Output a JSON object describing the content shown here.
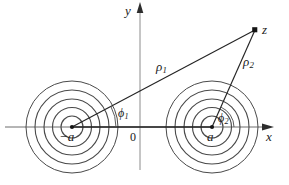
{
  "figure": {
    "background_color": "#ffffff",
    "stroke_color": "#3c3c3c",
    "axis_color": "#555555",
    "circle_color": "#4a4a4a",
    "ray_color": "#2a2a2a",
    "label_color": "#1a1a1a",
    "width": 289,
    "height": 185
  },
  "axes": {
    "x_label": "x",
    "y_label": "y",
    "origin_label": "0",
    "x_axis": {
      "x1": 5,
      "y1": 127,
      "x2": 272,
      "y2": 127
    },
    "y_axis": {
      "x1": 140,
      "y1": 170,
      "x2": 140,
      "y2": 4
    }
  },
  "poles": [
    {
      "name": "left-pole",
      "label": "−a",
      "cx": 72,
      "cy": 127
    },
    {
      "name": "right-pole",
      "label": "a",
      "cx": 212,
      "cy": 127
    }
  ],
  "circle_radii": [
    11,
    19.5,
    28,
    37,
    46
  ],
  "point_z": {
    "label": "z",
    "x": 255,
    "y": 30
  },
  "vectors": [
    {
      "name": "rho1",
      "label": "ρ",
      "subscript": "1",
      "from_x": 72,
      "from_y": 127,
      "to_x": 255,
      "to_y": 30
    },
    {
      "name": "rho2",
      "label": "ρ",
      "subscript": "2",
      "from_x": 212,
      "from_y": 127,
      "to_x": 255,
      "to_y": 30
    }
  ],
  "angles": [
    {
      "name": "phi1",
      "label": "ϕ",
      "subscript": "1",
      "vertex_x": 72,
      "vertex_y": 127,
      "arc_radius": 44,
      "degrees": 28
    },
    {
      "name": "phi2",
      "label": "ϕ",
      "subscript": "2",
      "vertex_x": 212,
      "vertex_y": 127,
      "arc_radius": 22,
      "degrees": 66
    }
  ],
  "labels": {
    "y": "y",
    "x": "x",
    "z": "z",
    "origin": "0",
    "minus_a": "−a",
    "a": "a",
    "rho": "ρ",
    "phi": "ϕ",
    "one": "1",
    "two": "2"
  }
}
